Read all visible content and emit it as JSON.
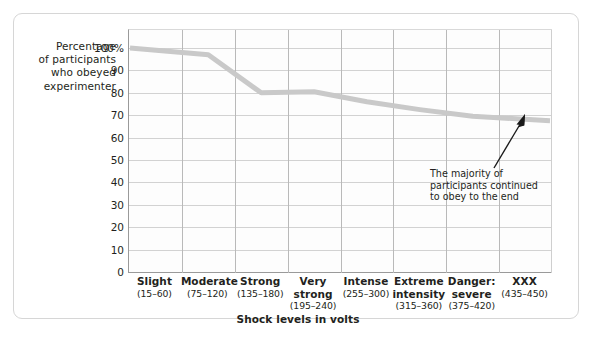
{
  "chart_data": {
    "type": "line",
    "title": "",
    "xlabel": "Shock levels in volts",
    "ylabel": "Percentage of participants who obeyed experimenter",
    "ylim": [
      0,
      100
    ],
    "yticks": [
      "0",
      "10",
      "20",
      "30",
      "40",
      "50",
      "60",
      "70",
      "80",
      "90",
      "100%"
    ],
    "ytick_values": [
      0,
      10,
      20,
      30,
      40,
      50,
      60,
      70,
      80,
      90,
      100
    ],
    "grid": true,
    "legend": "none",
    "categories": [
      "Slight",
      "Moderate",
      "Strong",
      "Very strong",
      "Intense",
      "Extreme intensity",
      "Danger: severe",
      "XXX"
    ],
    "category_ranges": [
      "(15–60)",
      "(75–120)",
      "(135–180)",
      "(195–240)",
      "(255–300)",
      "(315–360)",
      "(375–420)",
      "(435–450)"
    ],
    "values": [
      100,
      97,
      80,
      80.5,
      76,
      72.5,
      69.5,
      67.5
    ],
    "series": [
      {
        "name": "Percentage of participants who obeyed experimenter",
        "values": [
          100,
          97,
          80,
          80.5,
          76,
          72.5,
          69.5,
          67.5
        ],
        "color": "#c9c9c9"
      }
    ],
    "annotations": [
      {
        "text": "The majority of participants continued to obey to the end",
        "lines": [
          "The majority of",
          "participants continued",
          "to obey to the end"
        ],
        "arrow": "up-right"
      }
    ]
  },
  "axes": {
    "y_title_lines": [
      "Percentage",
      "of participants",
      "who obeyed",
      "experimenter"
    ],
    "x_title": "Shock levels in volts"
  },
  "colors": {
    "line": "#c9c9c9",
    "grid": "#d2d2d2",
    "vgrid": "#b9b9b9",
    "axis": "#9a9a9a",
    "text": "#231f20",
    "frame": "#d6d6d6",
    "plot_bg": "#fdfdfd"
  }
}
